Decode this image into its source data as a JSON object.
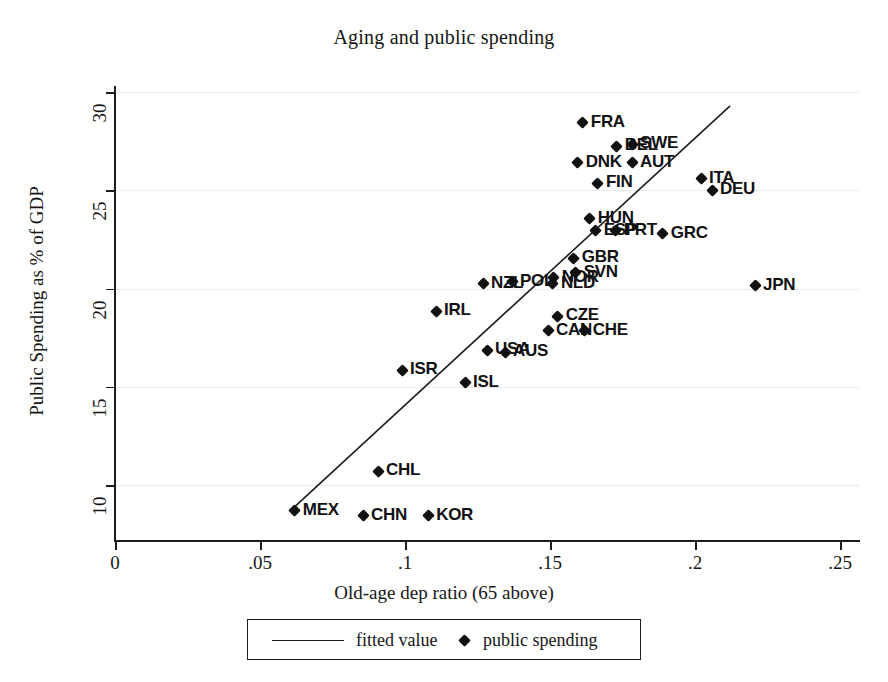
{
  "chart_data": {
    "type": "scatter",
    "title": "Aging and public spending",
    "xlabel": "Old-age dep ratio (65 above)",
    "ylabel": "Public Spending as % of GDP",
    "xlim": [
      0,
      0.25
    ],
    "ylim": [
      8.1,
      30.7
    ],
    "xticks": [
      "0",
      ".05",
      ".1",
      ".15",
      ".2",
      ".25"
    ],
    "xtick_values": [
      0,
      0.05,
      0.1,
      0.15,
      0.2,
      0.25
    ],
    "yticks": [
      "10",
      "15",
      "20",
      "25",
      "30"
    ],
    "ytick_values": [
      10,
      15,
      20,
      25,
      30
    ],
    "grid": "horizontal",
    "legend_position": "below-axis",
    "series": [
      {
        "name": "public spending",
        "marker": "diamond",
        "points": [
          {
            "label": "FRA",
            "x": 0.1613,
            "y": 28.45
          },
          {
            "label": "BEL",
            "x": 0.173,
            "y": 27.25
          },
          {
            "label": "SWE",
            "x": 0.1783,
            "y": 27.35
          },
          {
            "label": "DNK",
            "x": 0.1596,
            "y": 26.4
          },
          {
            "label": "AUT",
            "x": 0.1783,
            "y": 26.4
          },
          {
            "label": "FIN",
            "x": 0.1665,
            "y": 25.35
          },
          {
            "label": "ITA",
            "x": 0.2021,
            "y": 25.6
          },
          {
            "label": "DEU",
            "x": 0.2059,
            "y": 25.0
          },
          {
            "label": "HUN",
            "x": 0.1637,
            "y": 23.55
          },
          {
            "label": "ESP",
            "x": 0.1658,
            "y": 22.95
          },
          {
            "label": "PRT",
            "x": 0.1727,
            "y": 22.95
          },
          {
            "label": "GRC",
            "x": 0.1889,
            "y": 22.8
          },
          {
            "label": "GBR",
            "x": 0.1582,
            "y": 21.55
          },
          {
            "label": "SVN",
            "x": 0.1589,
            "y": 20.8
          },
          {
            "label": "NOR",
            "x": 0.1513,
            "y": 20.55
          },
          {
            "label": "NLD",
            "x": 0.151,
            "y": 20.25
          },
          {
            "label": "JPN",
            "x": 0.2207,
            "y": 20.15
          },
          {
            "label": "NZL",
            "x": 0.1269,
            "y": 20.25
          },
          {
            "label": "POL",
            "x": 0.1369,
            "y": 20.35
          },
          {
            "label": "IRL",
            "x": 0.1107,
            "y": 18.85
          },
          {
            "label": "CZE",
            "x": 0.1527,
            "y": 18.6
          },
          {
            "label": "CHE",
            "x": 0.162,
            "y": 17.85
          },
          {
            "label": "CAN",
            "x": 0.1493,
            "y": 17.85
          },
          {
            "label": "USA",
            "x": 0.1283,
            "y": 16.85
          },
          {
            "label": "AUS",
            "x": 0.1345,
            "y": 16.75
          },
          {
            "label": "ISR",
            "x": 0.099,
            "y": 15.85
          },
          {
            "label": "ISL",
            "x": 0.1207,
            "y": 15.2
          },
          {
            "label": "CHL",
            "x": 0.0907,
            "y": 10.7
          },
          {
            "label": "MEX",
            "x": 0.062,
            "y": 8.7
          },
          {
            "label": "CHN",
            "x": 0.0855,
            "y": 8.45
          },
          {
            "label": "KOR",
            "x": 0.108,
            "y": 8.45
          }
        ]
      },
      {
        "name": "fitted value",
        "type": "line",
        "x_start": 0.062,
        "y_start": 8.9,
        "x_end": 0.2121,
        "y_end": 29.3
      }
    ]
  },
  "legend": {
    "fitted_label": "fitted value",
    "points_label": "public spending"
  },
  "colors": {
    "ink": "#111111",
    "axis": "#1c1c1c",
    "grid": "#ebebeb",
    "background": "#ffffff"
  }
}
